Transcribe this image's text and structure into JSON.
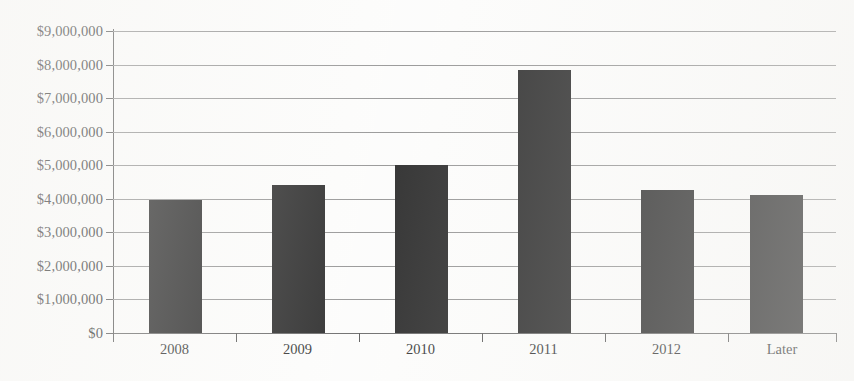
{
  "chart_data": {
    "type": "bar",
    "title": "",
    "subtitle": "",
    "xlabel": "",
    "ylabel": "",
    "categories": [
      "2008",
      "2009",
      "2010",
      "2011",
      "2012",
      "Later"
    ],
    "values": [
      3950000,
      4400000,
      5000000,
      7850000,
      4250000,
      4100000
    ],
    "series": [
      {
        "name": "Amount",
        "values": [
          3950000,
          4400000,
          5000000,
          7850000,
          4250000,
          4100000
        ]
      }
    ],
    "ylim": [
      0,
      9000000
    ],
    "ytick_values": [
      0,
      1000000,
      2000000,
      3000000,
      4000000,
      5000000,
      6000000,
      7000000,
      8000000,
      9000000
    ],
    "ytick_labels": [
      "$0",
      "$1,000,000",
      "$2,000,000",
      "$3,000,000",
      "$4,000,000",
      "$5,000,000",
      "$6,000,000",
      "$7,000,000",
      "$8,000,000",
      "$9,000,000"
    ],
    "grid": true,
    "grid_axis": "y",
    "legend": false,
    "legend_position": "none",
    "bar_color": "#141414",
    "gridline_color": "#8a8a8a",
    "axis_color": "#4a4a4a",
    "background_color": "#fcfcfb",
    "text_color": "#1b1b1b",
    "annotations": []
  }
}
